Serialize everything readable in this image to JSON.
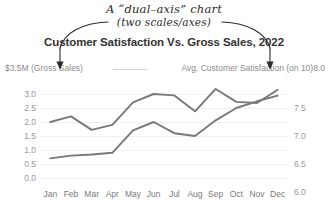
{
  "annotation": {
    "line1": "A “dual–axis” chart",
    "line2": "(two scales/axes)",
    "arrow_left_name": "annotation-arrow-left",
    "arrow_right_name": "annotation-arrow-right"
  },
  "chart_data": {
    "type": "line",
    "title": "Customer Satisfaction Vs. Gross Sales, 2022",
    "xlabel": "",
    "grid": true,
    "legend_position": "top",
    "categories": [
      "Jan",
      "Feb",
      "Mar",
      "Apr",
      "May",
      "Jun",
      "Jul",
      "Aug",
      "Sep",
      "Oct",
      "Nov",
      "Dec"
    ],
    "axes": {
      "left": {
        "label": "$3.5M (Gross Sales)",
        "top_tick_label": "$3.5M (Gross Sales)",
        "ticks": [
          "3.0",
          "2.5",
          "2.0",
          "1.5",
          "1.0",
          "0.5",
          "0.0"
        ],
        "tick_values": [
          3.0,
          2.5,
          2.0,
          1.5,
          1.0,
          0.5,
          0.0
        ],
        "range": [
          0.0,
          3.5
        ]
      },
      "right": {
        "label": "Avg. Customer Satisfaction (on 10)",
        "top_tick_label": "8.0",
        "ticks": [
          "7.5",
          "7.0",
          "6.5",
          "6.0"
        ],
        "tick_values": [
          7.5,
          7.0,
          6.5,
          6.0
        ],
        "range": [
          6.0,
          8.0
        ]
      }
    },
    "series": [
      {
        "name": "Gross Sales",
        "axis": "left",
        "color": "#77787a",
        "unit": "$M",
        "values": [
          2.0,
          2.2,
          1.72,
          1.9,
          2.7,
          3.0,
          2.95,
          2.38,
          3.18,
          2.72,
          2.68,
          3.15
        ]
      },
      {
        "name": "Avg. Customer Satisfaction (on 10)",
        "axis": "right",
        "color": "#77787a",
        "unit": "/10",
        "values": [
          6.6,
          6.65,
          6.67,
          6.7,
          7.1,
          7.25,
          7.05,
          7.0,
          7.28,
          7.5,
          7.62,
          7.72
        ]
      }
    ],
    "colors": {
      "line": "#77787a",
      "grid": "#f0f0f0",
      "tick_text": "#9a9a9a",
      "xlabel_text": "#7a7a7a",
      "legend_text": "#8c8c8c",
      "title_text": "#333333",
      "annotation_ink": "#2b2b2b",
      "background": "#ffffff"
    }
  }
}
